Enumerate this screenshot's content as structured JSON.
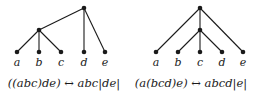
{
  "figure": {
    "background_color": "#ffffff",
    "ink_color": "#1a1a1a",
    "panels": [
      {
        "id": "left",
        "caption": "((abc)de) ↔ abc|de|",
        "leaf_labels": [
          "a",
          "b",
          "c",
          "d",
          "e"
        ],
        "leaf_x": [
          17,
          39,
          61,
          84,
          105
        ],
        "leaf_y": 52,
        "nodes": [
          {
            "name": "root",
            "x": 84,
            "y": 8
          },
          {
            "name": "internal",
            "x": 39,
            "y": 30
          },
          {
            "name": "leaf-a",
            "x": 17,
            "y": 52
          },
          {
            "name": "leaf-b",
            "x": 39,
            "y": 52
          },
          {
            "name": "leaf-c",
            "x": 61,
            "y": 52
          },
          {
            "name": "leaf-d",
            "x": 84,
            "y": 52
          },
          {
            "name": "leaf-e",
            "x": 105,
            "y": 52
          }
        ],
        "edges": [
          {
            "from": "root",
            "to": "internal"
          },
          {
            "from": "root",
            "to": "leaf-d"
          },
          {
            "from": "root",
            "to": "leaf-e"
          },
          {
            "from": "internal",
            "to": "leaf-a"
          },
          {
            "from": "internal",
            "to": "leaf-b"
          },
          {
            "from": "internal",
            "to": "leaf-c"
          }
        ]
      },
      {
        "id": "right",
        "caption": "(a(bcd)e) ↔ abcd|e|",
        "leaf_labels": [
          "a",
          "b",
          "c",
          "d",
          "e"
        ],
        "leaf_x": [
          29,
          51,
          73,
          95,
          116
        ],
        "leaf_y": 52,
        "nodes": [
          {
            "name": "root",
            "x": 73,
            "y": 8
          },
          {
            "name": "internal",
            "x": 73,
            "y": 30
          },
          {
            "name": "leaf-a",
            "x": 29,
            "y": 52
          },
          {
            "name": "leaf-b",
            "x": 51,
            "y": 52
          },
          {
            "name": "leaf-c",
            "x": 73,
            "y": 52
          },
          {
            "name": "leaf-d",
            "x": 95,
            "y": 52
          },
          {
            "name": "leaf-e",
            "x": 116,
            "y": 52
          }
        ],
        "edges": [
          {
            "from": "root",
            "to": "leaf-a"
          },
          {
            "from": "root",
            "to": "internal"
          },
          {
            "from": "root",
            "to": "leaf-e"
          },
          {
            "from": "internal",
            "to": "leaf-b"
          },
          {
            "from": "internal",
            "to": "leaf-c"
          },
          {
            "from": "internal",
            "to": "leaf-d"
          }
        ]
      }
    ]
  }
}
